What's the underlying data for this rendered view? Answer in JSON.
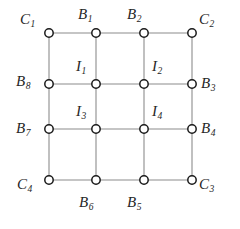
{
  "figure": {
    "type": "grid-graph-diagram",
    "width": 240,
    "height": 229,
    "background_color": "#ffffff",
    "edge_color": "#8c8c8c",
    "node_stroke_color": "#1a1a1a",
    "node_fill_color": "#ffffff",
    "label_color": "#262626",
    "node_radius": 4.2,
    "columns_x": [
      49,
      96,
      144,
      192
    ],
    "rows_y": [
      33,
      84,
      129,
      180
    ]
  },
  "nodes": [
    {
      "id": "n-r0-c0",
      "label": "C",
      "sub": "1",
      "cx": 49,
      "cy": 33,
      "label_x": 20,
      "label_y": 12,
      "kind": "corner"
    },
    {
      "id": "n-r0-c1",
      "label": "B",
      "sub": "1",
      "cx": 96,
      "cy": 33,
      "label_x": 78,
      "label_y": 7,
      "kind": "boundary"
    },
    {
      "id": "n-r0-c2",
      "label": "B",
      "sub": "2",
      "cx": 144,
      "cy": 33,
      "label_x": 127,
      "label_y": 7,
      "kind": "boundary"
    },
    {
      "id": "n-r0-c3",
      "label": "C",
      "sub": "2",
      "cx": 192,
      "cy": 33,
      "label_x": 199,
      "label_y": 12,
      "kind": "corner"
    },
    {
      "id": "n-r1-c0",
      "label": "B",
      "sub": "8",
      "cx": 49,
      "cy": 84,
      "label_x": 16,
      "label_y": 74,
      "kind": "boundary"
    },
    {
      "id": "n-r1-c1",
      "label": "I",
      "sub": "1",
      "cx": 96,
      "cy": 84,
      "label_x": 76,
      "label_y": 59,
      "kind": "interior"
    },
    {
      "id": "n-r1-c2",
      "label": "I",
      "sub": "2",
      "cx": 144,
      "cy": 84,
      "label_x": 152,
      "label_y": 59,
      "kind": "interior"
    },
    {
      "id": "n-r1-c3",
      "label": "B",
      "sub": "3",
      "cx": 192,
      "cy": 84,
      "label_x": 201,
      "label_y": 76,
      "kind": "boundary"
    },
    {
      "id": "n-r2-c0",
      "label": "B",
      "sub": "7",
      "cx": 49,
      "cy": 129,
      "label_x": 16,
      "label_y": 121,
      "kind": "boundary"
    },
    {
      "id": "n-r2-c1",
      "label": "I",
      "sub": "3",
      "cx": 96,
      "cy": 129,
      "label_x": 76,
      "label_y": 104,
      "kind": "interior"
    },
    {
      "id": "n-r2-c2",
      "label": "I",
      "sub": "4",
      "cx": 144,
      "cy": 129,
      "label_x": 152,
      "label_y": 104,
      "kind": "interior"
    },
    {
      "id": "n-r2-c3",
      "label": "B",
      "sub": "4",
      "cx": 192,
      "cy": 129,
      "label_x": 201,
      "label_y": 121,
      "kind": "boundary"
    },
    {
      "id": "n-r3-c0",
      "label": "C",
      "sub": "4",
      "cx": 49,
      "cy": 180,
      "label_x": 17,
      "label_y": 177,
      "kind": "corner"
    },
    {
      "id": "n-r3-c1",
      "label": "B",
      "sub": "6",
      "cx": 96,
      "cy": 180,
      "label_x": 79,
      "label_y": 195,
      "kind": "boundary"
    },
    {
      "id": "n-r3-c2",
      "label": "B",
      "sub": "5",
      "cx": 144,
      "cy": 180,
      "label_x": 127,
      "label_y": 195,
      "kind": "boundary"
    },
    {
      "id": "n-r3-c3",
      "label": "C",
      "sub": "3",
      "cx": 192,
      "cy": 180,
      "label_x": 199,
      "label_y": 177,
      "kind": "corner"
    }
  ],
  "edges": [
    {
      "x1": 49,
      "y1": 33,
      "x2": 192,
      "y2": 33
    },
    {
      "x1": 49,
      "y1": 84,
      "x2": 192,
      "y2": 84
    },
    {
      "x1": 49,
      "y1": 129,
      "x2": 192,
      "y2": 129
    },
    {
      "x1": 49,
      "y1": 180,
      "x2": 192,
      "y2": 180
    },
    {
      "x1": 49,
      "y1": 33,
      "x2": 49,
      "y2": 180
    },
    {
      "x1": 96,
      "y1": 33,
      "x2": 96,
      "y2": 180
    },
    {
      "x1": 144,
      "y1": 33,
      "x2": 144,
      "y2": 180
    },
    {
      "x1": 192,
      "y1": 33,
      "x2": 192,
      "y2": 180
    }
  ]
}
